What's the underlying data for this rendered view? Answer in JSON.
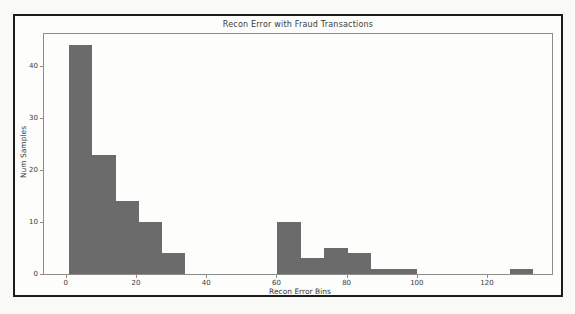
{
  "chart_data": {
    "type": "bar",
    "subtype": "histogram",
    "title": "Recon Error with Fraud Transactions",
    "xlabel": "Recon Error Bins",
    "ylabel": "Num Samples",
    "bin_edges": [
      0.9,
      7.5,
      14.1,
      20.7,
      27.3,
      33.9,
      40.5,
      47.1,
      53.7,
      60.3,
      67.0,
      73.6,
      80.2,
      86.8,
      93.4,
      100.0,
      106.6,
      113.2,
      119.8,
      126.4,
      133.0
    ],
    "counts": [
      44,
      23,
      14,
      10,
      4,
      0,
      0,
      0,
      0,
      10,
      3,
      5,
      4,
      1,
      1,
      0,
      0,
      0,
      0,
      1
    ],
    "xticks": [
      0,
      20,
      40,
      60,
      80,
      100,
      120
    ],
    "yticks": [
      0,
      10,
      20,
      30,
      40
    ],
    "xlim": [
      -6.2,
      138.5
    ],
    "ylim": [
      0,
      46.2
    ],
    "grid": false,
    "legend_position": "none",
    "bar_color": "#6b6b6b"
  },
  "colors": {
    "page_background": "#f9f9f7",
    "frame_border": "#1c1c1c",
    "figure_background": "#fdfdfc",
    "axes_spine": "#8c8c8c",
    "text": "#3b3b3b",
    "bar": "#6b6b6b"
  }
}
